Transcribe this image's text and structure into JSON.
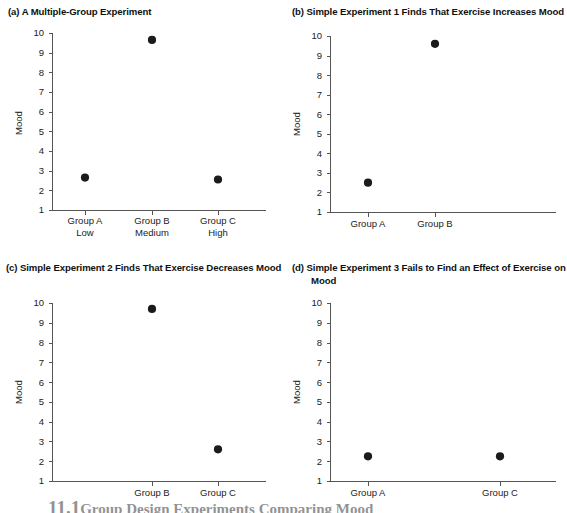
{
  "figure": {
    "width": 556,
    "height": 513,
    "background": "#ffffff",
    "point_color": "#1b1b1b",
    "axis_color": "#555555",
    "text_color": "#222222"
  },
  "caption": {
    "number": "11.1",
    "text": "Group Design Experiments Comparing Mood"
  },
  "panels": {
    "a": {
      "title": "(a) A Multiple-Group Experiment",
      "ylabel": "Mood",
      "yticks": [
        "10",
        "9",
        "8",
        "7",
        "6",
        "5",
        "4",
        "3",
        "2",
        "1"
      ],
      "xticks": [
        "Group A\nLow",
        "Group B\nMedium",
        "Group C\nHigh"
      ]
    },
    "b": {
      "title": "(b) Simple Experiment 1 Finds That Exercise Increases Mood",
      "ylabel": "Mood",
      "yticks": [
        "10",
        "9",
        "8",
        "7",
        "6",
        "5",
        "4",
        "3",
        "2",
        "1"
      ],
      "xticks": [
        "Group A",
        "Group B"
      ]
    },
    "c": {
      "title": "(c) Simple Experiment 2 Finds That Exercise Decreases Mood",
      "ylabel": "Mood",
      "yticks": [
        "10",
        "9",
        "8",
        "7",
        "6",
        "5",
        "4",
        "3",
        "2",
        "1"
      ],
      "xticks": [
        "Group B",
        "Group C"
      ]
    },
    "d": {
      "title": "(d) Simple Experiment 3 Fails to Find an Effect of Exercise on Mood",
      "ylabel": "Mood",
      "yticks": [
        "10",
        "9",
        "8",
        "7",
        "6",
        "5",
        "4",
        "3",
        "2",
        "1"
      ],
      "xticks": [
        "Group A",
        "Group C"
      ]
    }
  },
  "chart_data": [
    {
      "panel": "a",
      "type": "scatter",
      "title": "(a) A Multiple-Group Experiment",
      "xlabel": "",
      "ylabel": "Mood",
      "ylim": [
        1,
        10
      ],
      "yticks": [
        1,
        2,
        3,
        4,
        5,
        6,
        7,
        8,
        9,
        10
      ],
      "grid": false,
      "legend": "none",
      "categories": [
        "Group A\nLow",
        "Group B\nMedium",
        "Group C\nHigh"
      ],
      "values": [
        2.65,
        9.65,
        2.55
      ]
    },
    {
      "panel": "b",
      "type": "scatter",
      "title": "(b) Simple Experiment 1 Finds That Exercise Increases Mood",
      "xlabel": "",
      "ylabel": "Mood",
      "ylim": [
        1,
        10
      ],
      "yticks": [
        1,
        2,
        3,
        4,
        5,
        6,
        7,
        8,
        9,
        10
      ],
      "grid": false,
      "legend": "none",
      "categories": [
        "Group A",
        "Group B"
      ],
      "values": [
        2.5,
        9.6
      ]
    },
    {
      "panel": "c",
      "type": "scatter",
      "title": "(c) Simple Experiment 2 Finds That Exercise Decreases Mood",
      "xlabel": "",
      "ylabel": "Mood",
      "ylim": [
        1,
        10
      ],
      "yticks": [
        1,
        2,
        3,
        4,
        5,
        6,
        7,
        8,
        9,
        10
      ],
      "grid": false,
      "legend": "none",
      "categories": [
        "Group B",
        "Group C"
      ],
      "values": [
        9.7,
        2.6
      ]
    },
    {
      "panel": "d",
      "type": "scatter",
      "title": "(d) Simple Experiment 3 Fails to Find an Effect of Exercise on Mood",
      "xlabel": "",
      "ylabel": "Mood",
      "ylim": [
        1,
        10
      ],
      "yticks": [
        1,
        2,
        3,
        4,
        5,
        6,
        7,
        8,
        9,
        10
      ],
      "grid": false,
      "legend": "none",
      "categories": [
        "Group A",
        "Group C"
      ],
      "values": [
        2.25,
        2.25
      ]
    }
  ]
}
